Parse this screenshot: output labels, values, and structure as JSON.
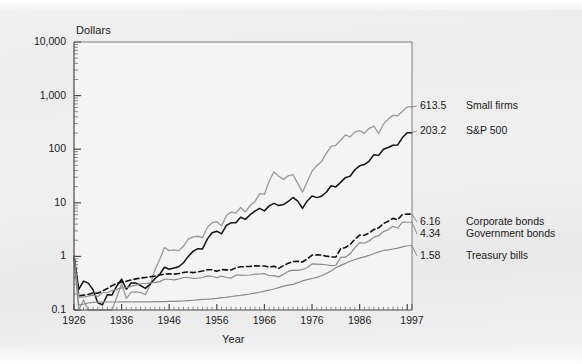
{
  "chart_data": {
    "type": "line",
    "title": "",
    "xlabel": "Year",
    "ylabel": "Dollars",
    "yscale": "log",
    "ylim": [
      0.1,
      10000
    ],
    "xlim": [
      1926,
      1997
    ],
    "grid": false,
    "legend_position": "right-inline-annotations",
    "y_tick_labels": [
      "10,000",
      "1,000",
      "100",
      "10",
      "1",
      "0.1"
    ],
    "y_tick_values": [
      10000,
      1000,
      100,
      10,
      1,
      0.1
    ],
    "x_tick_labels": [
      "1926",
      "1936",
      "1946",
      "1956",
      "1966",
      "1976",
      "1986",
      "1997"
    ],
    "x_tick_values": [
      1926,
      1936,
      1946,
      1956,
      1966,
      1976,
      1986,
      1997
    ],
    "x": [
      1926,
      1927,
      1928,
      1929,
      1930,
      1931,
      1932,
      1933,
      1934,
      1935,
      1936,
      1937,
      1938,
      1939,
      1940,
      1941,
      1942,
      1943,
      1944,
      1945,
      1946,
      1947,
      1948,
      1949,
      1950,
      1951,
      1952,
      1953,
      1954,
      1955,
      1956,
      1957,
      1958,
      1959,
      1960,
      1961,
      1962,
      1963,
      1964,
      1965,
      1966,
      1967,
      1968,
      1969,
      1970,
      1971,
      1972,
      1973,
      1974,
      1975,
      1976,
      1977,
      1978,
      1979,
      1980,
      1981,
      1982,
      1983,
      1984,
      1985,
      1986,
      1987,
      1988,
      1989,
      1990,
      1991,
      1992,
      1993,
      1994,
      1995,
      1996,
      1997
    ],
    "series": [
      {
        "name": "Small firms",
        "end_value": 613.5,
        "end_label": "613.5",
        "color": "#999999",
        "style": "solid",
        "width": 1.3,
        "values": [
          1.0,
          1.22,
          1.92,
          1.08,
          0.63,
          0.31,
          0.33,
          1.02,
          1.26,
          2.19,
          3.88,
          2.06,
          2.72,
          2.74,
          2.66,
          2.44,
          3.66,
          7.05,
          11.0,
          18.4,
          16.1,
          16.6,
          16.1,
          19.5,
          26.4,
          29.0,
          29.9,
          28.3,
          43.7,
          53.4,
          56.0,
          46.7,
          73.2,
          84.6,
          80.8,
          103.0,
          85.1,
          112.0,
          132.0,
          186.0,
          180.0,
          321.0,
          475.0,
          395.0,
          344.0,
          402.0,
          421.0,
          290.0,
          198.0,
          311.0,
          490.0,
          618.0,
          744.0,
          1050.0,
          1420.0,
          1490.0,
          1850.0,
          2320.0,
          2140.0,
          2620.0,
          2790.0,
          2490.0,
          3090.0,
          3380.0,
          2470.0,
          3680.0,
          4590.0,
          5380.0,
          5290.0,
          6450.0,
          7720.0,
          613.5
        ]
      },
      {
        "name": "S&P 500",
        "end_value": 203.2,
        "end_label": "203.2",
        "color": "#111111",
        "style": "solid",
        "width": 1.5,
        "values": [
          1.0,
          1.37,
          1.96,
          1.8,
          1.35,
          0.77,
          0.71,
          1.09,
          1.08,
          1.59,
          2.13,
          1.38,
          1.81,
          1.8,
          1.62,
          1.43,
          1.72,
          2.17,
          2.6,
          3.55,
          3.26,
          3.44,
          3.63,
          4.3,
          5.66,
          7.02,
          7.88,
          7.8,
          11.9,
          15.6,
          16.7,
          14.9,
          21.4,
          23.9,
          24.0,
          30.4,
          27.8,
          34.0,
          39.6,
          44.5,
          40.0,
          49.6,
          55.1,
          50.4,
          52.4,
          59.9,
          71.2,
          60.8,
          44.7,
          61.4,
          76.0,
          70.6,
          75.2,
          89.1,
          118.0,
          112.0,
          136.0,
          167.0,
          177.0,
          234.0,
          277.0,
          292.0,
          340.0,
          448.0,
          434.0,
          566.0,
          609.0,
          671.0,
          679.0,
          934.0,
          1150.0,
          203.2
        ]
      },
      {
        "name": "Corporate bonds",
        "end_value": 6.16,
        "end_label": "6.16",
        "color": "#111111",
        "style": "dashed",
        "width": 1.6,
        "values": [
          1.0,
          1.07,
          1.11,
          1.14,
          1.22,
          1.2,
          1.33,
          1.47,
          1.67,
          1.83,
          1.96,
          2.01,
          2.14,
          2.23,
          2.31,
          2.37,
          2.44,
          2.51,
          2.63,
          2.73,
          2.78,
          2.73,
          2.82,
          2.94,
          3.01,
          2.92,
          3.02,
          3.13,
          3.3,
          3.31,
          3.08,
          3.33,
          3.29,
          3.27,
          3.58,
          3.75,
          3.78,
          3.82,
          3.91,
          3.89,
          3.89,
          3.71,
          3.82,
          3.51,
          3.94,
          4.38,
          4.7,
          4.76,
          4.61,
          5.28,
          6.2,
          6.25,
          6.2,
          5.92,
          5.72,
          5.7,
          8.1,
          8.58,
          9.76,
          12.3,
          14.6,
          14.5,
          16.1,
          18.6,
          20.0,
          24.0,
          26.6,
          30.0,
          28.4,
          35.5,
          36.1,
          6.16
        ]
      },
      {
        "name": "Government bonds",
        "end_value": 4.34,
        "end_label": "4.34",
        "color": "#8a8a8a",
        "style": "solid",
        "width": 1.2,
        "values": [
          1.0,
          1.09,
          1.09,
          1.13,
          1.18,
          1.12,
          1.31,
          1.31,
          1.44,
          1.51,
          1.62,
          1.63,
          1.72,
          1.82,
          1.93,
          1.95,
          2.01,
          2.05,
          2.11,
          2.34,
          2.34,
          2.28,
          2.36,
          2.52,
          2.52,
          2.42,
          2.44,
          2.52,
          2.7,
          2.66,
          2.5,
          2.68,
          2.52,
          2.46,
          2.79,
          2.81,
          2.78,
          2.81,
          2.91,
          2.93,
          2.99,
          2.72,
          2.73,
          2.59,
          2.9,
          3.28,
          3.46,
          3.42,
          3.56,
          3.88,
          4.52,
          4.48,
          4.42,
          4.36,
          4.19,
          4.27,
          5.97,
          6.03,
          6.97,
          9.11,
          11.3,
          11.0,
          12.1,
          14.3,
          15.2,
          18.1,
          19.6,
          22.8,
          21.1,
          27.2,
          27.1,
          4.34
        ]
      },
      {
        "name": "Treasury bills",
        "end_value": 1.58,
        "end_label": "1.58",
        "color": "#8a8a8a",
        "style": "solid",
        "width": 1.2,
        "values": [
          1.0,
          1.03,
          1.07,
          1.12,
          1.15,
          1.16,
          1.17,
          1.17,
          1.17,
          1.17,
          1.18,
          1.18,
          1.18,
          1.18,
          1.18,
          1.18,
          1.18,
          1.19,
          1.19,
          1.19,
          1.2,
          1.2,
          1.21,
          1.22,
          1.24,
          1.26,
          1.28,
          1.31,
          1.32,
          1.34,
          1.37,
          1.41,
          1.43,
          1.48,
          1.52,
          1.55,
          1.6,
          1.65,
          1.71,
          1.78,
          1.86,
          1.94,
          2.04,
          2.17,
          2.31,
          2.41,
          2.5,
          2.68,
          2.89,
          3.06,
          3.21,
          3.37,
          3.61,
          3.99,
          4.44,
          5.1,
          5.64,
          6.13,
          6.73,
          7.25,
          7.7,
          8.12,
          8.64,
          9.39,
          10.1,
          10.7,
          11.0,
          11.4,
          11.8,
          12.5,
          13.1,
          1.58
        ]
      }
    ],
    "annotations": [
      {
        "value": "613.5",
        "label": "Small firms"
      },
      {
        "value": "203.2",
        "label": "S&P 500"
      },
      {
        "value": "6.16",
        "label": "Corporate bonds"
      },
      {
        "value": "4.34",
        "label": "Government bonds"
      },
      {
        "value": "1.58",
        "label": "Treasury bills"
      }
    ]
  },
  "axes": {
    "y_title": "Dollars",
    "x_title": "Year",
    "y_ticks": [
      {
        "label": "10,000"
      },
      {
        "label": "1,000"
      },
      {
        "label": "100"
      },
      {
        "label": "10"
      },
      {
        "label": "1"
      },
      {
        "label": "0.1"
      }
    ],
    "x_ticks": [
      {
        "label": "1926"
      },
      {
        "label": "1936"
      },
      {
        "label": "1946"
      },
      {
        "label": "1956"
      },
      {
        "label": "1966"
      },
      {
        "label": "1976"
      },
      {
        "label": "1986"
      },
      {
        "label": "1997"
      }
    ]
  },
  "colors": {
    "page_background": "#efefef",
    "plot_background": "#f4f4f4",
    "axis": "#4a4a4a",
    "small_firms": "#999999",
    "sp500": "#111111",
    "corporate_bonds": "#111111",
    "government_bonds": "#8a8a8a",
    "treasury_bills": "#8a8a8a",
    "text": "#1a1a1a"
  }
}
